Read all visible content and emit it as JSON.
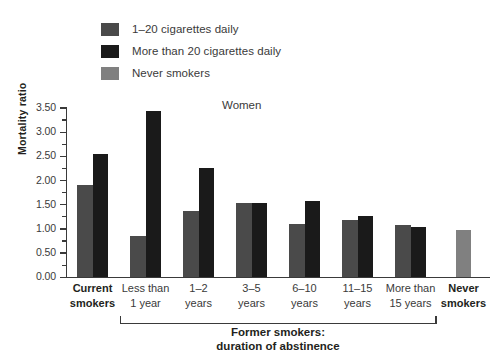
{
  "chart_data": {
    "type": "bar",
    "title": "Women",
    "xlabel": "",
    "ylabel": "Mortality ratio",
    "ylim": [
      0,
      3.5
    ],
    "ytick_step": 0.5,
    "yminor_step": 0.25,
    "ytick_labels": [
      "0.00",
      "0.50",
      "1.00",
      "1.50",
      "2.00",
      "2.50",
      "3.00",
      "3.50"
    ],
    "grid": false,
    "legend_position": "top-left",
    "categories": [
      "Current smokers",
      "Less than 1 year",
      "1–2 years",
      "3–5 years",
      "6–10 years",
      "11–15 years",
      "More than 15 years",
      "Never smokers"
    ],
    "series": [
      {
        "name": "1–20 cigarettes daily",
        "color": "#4a4a4a",
        "values": [
          1.9,
          0.85,
          1.38,
          1.53,
          1.11,
          1.18,
          1.08,
          null
        ]
      },
      {
        "name": "More than 20 cigarettes daily",
        "color": "#1a1a1a",
        "values": [
          2.55,
          3.43,
          2.27,
          1.53,
          1.57,
          1.27,
          1.03,
          null
        ]
      },
      {
        "name": "Never smokers",
        "color": "#808080",
        "values": [
          null,
          null,
          null,
          null,
          null,
          null,
          null,
          0.98
        ]
      }
    ],
    "annotations": [
      {
        "text": "Former smokers: duration of abstinence",
        "line1": "Former smokers:",
        "line2": "duration of abstinence",
        "spans_categories": [
          "Less than 1 year",
          "More than 15 years"
        ]
      }
    ]
  },
  "legend": {
    "items": [
      {
        "label": "1–20 cigarettes daily",
        "swatch_name": "legend-swatch-dark-gray",
        "color": "#4a4a4a"
      },
      {
        "label": "More than 20 cigarettes daily",
        "swatch_name": "legend-swatch-black",
        "color": "#1a1a1a"
      },
      {
        "label": "Never smokers",
        "swatch_name": "legend-swatch-gray",
        "color": "#808080"
      }
    ]
  },
  "axis": {
    "x_categories_display": [
      {
        "line1": "Current",
        "line2": "smokers",
        "bold": true
      },
      {
        "line1": "Less than",
        "line2": "1 year",
        "bold": false
      },
      {
        "line1": "1–2",
        "line2": "years",
        "bold": false
      },
      {
        "line1": "3–5",
        "line2": "years",
        "bold": false
      },
      {
        "line1": "6–10",
        "line2": "years",
        "bold": false
      },
      {
        "line1": "11–15",
        "line2": "years",
        "bold": false
      },
      {
        "line1": "More than",
        "line2": "15 years",
        "bold": false
      },
      {
        "line1": "Never",
        "line2": "smokers",
        "bold": true
      }
    ]
  },
  "bracket": {
    "line1": "Former smokers:",
    "line2": "duration of abstinence"
  }
}
